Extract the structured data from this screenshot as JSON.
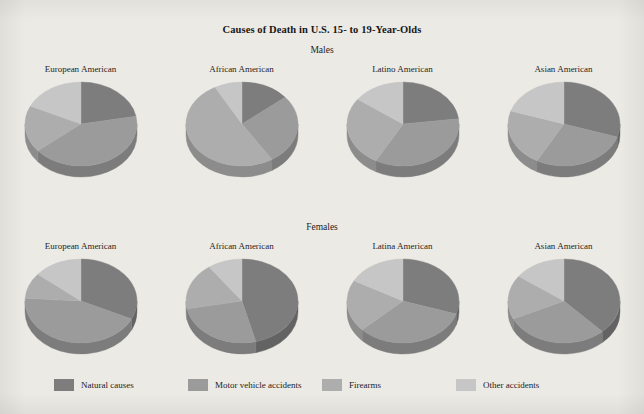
{
  "figure": {
    "title": "Causes of Death in U.S. 15- to 19-Year-Olds",
    "background_color": "#eceae5",
    "panels": [
      {
        "heading": "Males"
      },
      {
        "heading": "Females"
      }
    ]
  },
  "legend": {
    "position": "bottom",
    "items": [
      {
        "label": "Natural causes",
        "color": "#7d7d7d",
        "swatch_name": "legend-swatch-natural-causes"
      },
      {
        "label": "Motor vehicle accidents",
        "color": "#9b9b9b",
        "swatch_name": "legend-swatch-motor-vehicle-accidents"
      },
      {
        "label": "Firearms",
        "color": "#adadad",
        "swatch_name": "legend-swatch-firearms"
      },
      {
        "label": "Other accidents",
        "color": "#c6c6c6",
        "swatch_name": "legend-swatch-other-accidents"
      }
    ]
  },
  "chart_data": {
    "type": "pie",
    "title": "Causes of Death in U.S. 15- to 19-Year-Olds",
    "xlabel": "",
    "ylabel": "",
    "units": "percent of deaths",
    "categories": [
      "Natural causes",
      "Motor vehicle accidents",
      "Firearms",
      "Other accidents"
    ],
    "colors": [
      "#7d7d7d",
      "#9b9b9b",
      "#adadad",
      "#c6c6c6"
    ],
    "side_colors": [
      "#636363",
      "#7c7c7c",
      "#8c8c8c",
      "#a1a1a1"
    ],
    "panels": [
      {
        "heading": "Males",
        "pies": [
          {
            "label": "European American",
            "values": [
              22,
              42,
              18,
              18
            ]
          },
          {
            "label": "African American",
            "values": [
              14,
              27,
              51,
              8
            ]
          },
          {
            "label": "Latino American",
            "values": [
              23,
              35,
              27,
              15
            ]
          },
          {
            "label": "Asian American",
            "values": [
              30,
              28,
              22,
              20
            ]
          }
        ]
      },
      {
        "heading": "Females",
        "pies": [
          {
            "label": "European American",
            "values": [
              32,
              44,
              10,
              14
            ]
          },
          {
            "label": "African American",
            "values": [
              46,
              26,
              18,
              10
            ]
          },
          {
            "label": "Latina American",
            "values": [
              30,
              33,
              20,
              17
            ]
          },
          {
            "label": "Asian American",
            "values": [
              38,
              30,
              17,
              15
            ]
          }
        ]
      }
    ]
  }
}
